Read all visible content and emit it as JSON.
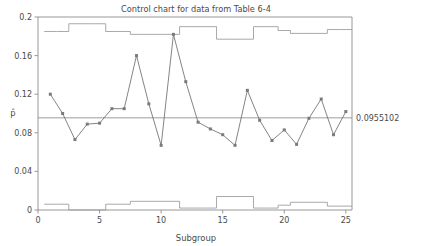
{
  "chart_data": {
    "type": "line",
    "title": "Control chart for data from Table 6-4",
    "xlabel": "Subgroup",
    "ylabel": "p̂",
    "xlim": [
      0,
      25.5
    ],
    "ylim": [
      0,
      0.2
    ],
    "xticks": [
      0,
      5,
      10,
      15,
      20,
      25
    ],
    "xtick_labels": [
      "0",
      "5",
      "10",
      "15",
      "20",
      "25"
    ],
    "yticks": [
      0,
      0.04,
      0.08,
      0.12,
      0.16,
      0.2
    ],
    "ytick_labels": [
      "0",
      "0.04",
      "0.08",
      "0.12",
      "0.16",
      "0.2"
    ],
    "grid": false,
    "legend": "none",
    "x": [
      1,
      2,
      3,
      4,
      5,
      6,
      7,
      8,
      9,
      10,
      11,
      12,
      13,
      14,
      15,
      16,
      17,
      18,
      19,
      20,
      21,
      22,
      23,
      24,
      25
    ],
    "series": [
      {
        "name": "p-hat",
        "marker": "square",
        "values": [
          0.12,
          0.1,
          0.073,
          0.089,
          0.09,
          0.105,
          0.105,
          0.16,
          0.11,
          0.067,
          0.182,
          0.133,
          0.091,
          0.084,
          0.078,
          0.067,
          0.124,
          0.093,
          0.072,
          0.083,
          0.068,
          0.095,
          0.115,
          0.078,
          0.102
        ]
      },
      {
        "name": "UCL",
        "marker": "none",
        "step": true,
        "values": [
          0.185,
          0.185,
          0.193,
          0.193,
          0.193,
          0.185,
          0.185,
          0.182,
          0.182,
          0.182,
          0.182,
          0.19,
          0.19,
          0.19,
          0.177,
          0.177,
          0.177,
          0.19,
          0.19,
          0.186,
          0.183,
          0.183,
          0.183,
          0.187,
          0.187
        ]
      },
      {
        "name": "LCL",
        "marker": "none",
        "step": true,
        "values": [
          0.006,
          0.006,
          0.0,
          0.0,
          0.0,
          0.006,
          0.006,
          0.009,
          0.009,
          0.009,
          0.009,
          0.002,
          0.002,
          0.002,
          0.014,
          0.014,
          0.014,
          0.002,
          0.002,
          0.005,
          0.008,
          0.008,
          0.008,
          0.004,
          0.004
        ]
      }
    ],
    "center_line": {
      "name": "center-line",
      "value": 0.0955102,
      "label": "0.0955102"
    },
    "colors": {
      "series": "#6e6e6e",
      "limits": "#9a9a9a",
      "frame": "#8c8c8c",
      "text": "#4a4a4a",
      "background": "#ffffff"
    }
  }
}
